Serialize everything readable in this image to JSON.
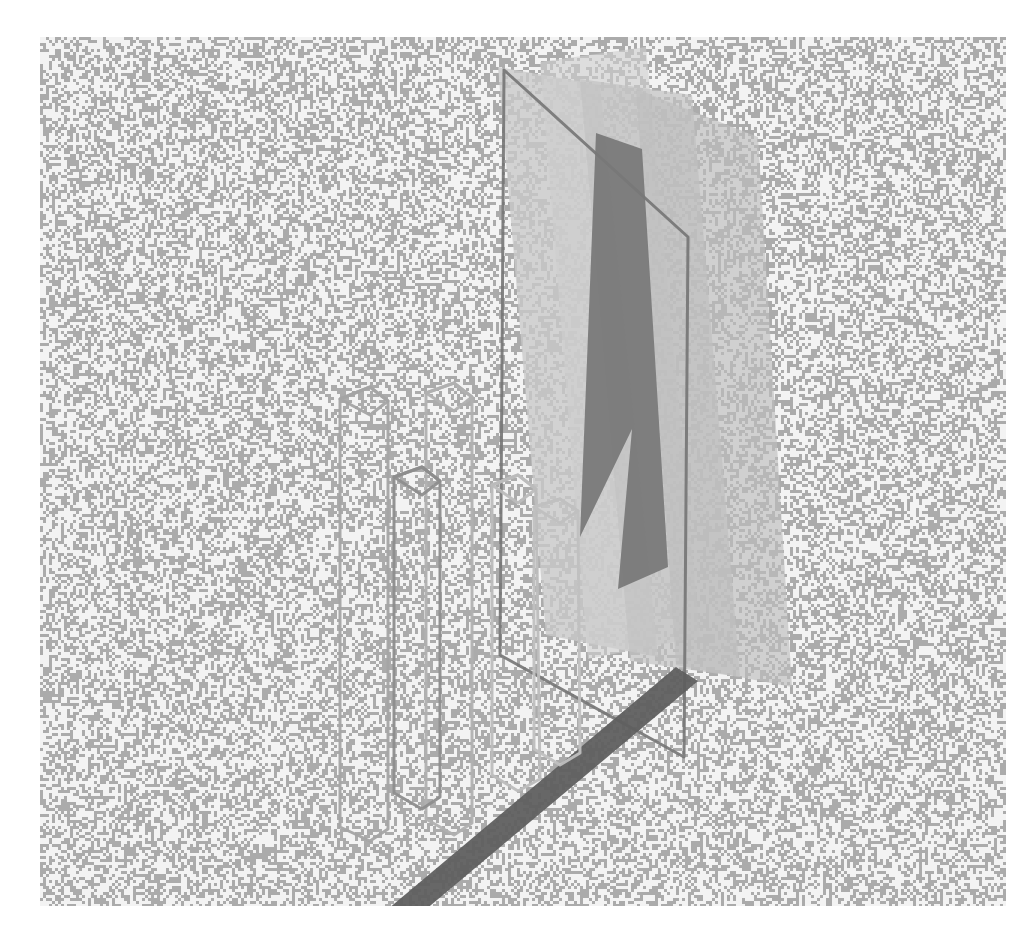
{
  "artwork": {
    "title": "Abstract Grayscale 3D Wireframe Composition",
    "medium": "raster-dither-render",
    "canvas": {
      "image_width": 1029,
      "image_height": 933,
      "margin_color": "#ffffff",
      "board_x": 40,
      "board_y": 37,
      "board_width": 966,
      "board_height": 869
    },
    "background": {
      "name": "dithered-noise-field",
      "pattern": "random two-tone pixel dither",
      "light_color": "#f3f3f3",
      "dark_color": "#ababab",
      "cell_size": 3,
      "dark_ratio": 0.46
    },
    "palette": {
      "line_light": "#b9b9b9",
      "line_mid": "#9a9a9a",
      "line_dark": "#6e6e6e",
      "line_darkest": "#5a5a5a",
      "fill_pale": "#d7d7d7",
      "fill_light": "#c6c6c6",
      "fill_mid": "#b2b2b2",
      "fill_dark": "#8e8e8e",
      "fill_darker": "#7c7c7c",
      "band_dark": "#6f6f6f"
    },
    "composition": {
      "description": "Translucent overlapping quadrilateral planes on the right, hollow wireframe prism columns on the left, joined by a heavy dark diagonal base band.",
      "groups": [
        {
          "name": "right-plane-cluster",
          "kind": "translucent-planes",
          "count": 6,
          "note": "Tall leaning parallelogram sheets in graduated grays"
        },
        {
          "name": "left-column-cluster",
          "kind": "wireframe-prisms",
          "count": 5,
          "note": "Hollow rectangular tubes drawn as outlines with hexagonal top caps"
        },
        {
          "name": "base-band",
          "kind": "solid-band",
          "count": 1,
          "note": "Thick dark diagonal strip running from lower-left apex up to the right"
        }
      ]
    },
    "shapes": {
      "planes": [
        {
          "name": "plane-outer-left",
          "points": "458,30 560,48 618,620 506,598",
          "fill": "#c9c9c9",
          "opacity": 0.8,
          "stroke": "none",
          "stroke_width": 0
        },
        {
          "name": "plane-tall-pale",
          "points": "500,25 606,10 660,600 548,622",
          "fill": "#cfcfcf",
          "opacity": 0.62,
          "stroke": "none",
          "stroke_width": 0
        },
        {
          "name": "plane-mid-light",
          "points": "540,42 652,58 700,640 590,624",
          "fill": "#c2c2c2",
          "opacity": 0.7,
          "stroke": "none",
          "stroke_width": 0
        },
        {
          "name": "plane-right-wide",
          "points": "596,52 718,100 752,650 636,628",
          "fill": "#bdbdbd",
          "opacity": 0.66,
          "stroke": "none",
          "stroke_width": 0
        },
        {
          "name": "plane-outline-big",
          "points": "464,33 648,200 644,720 460,618",
          "fill": "none",
          "opacity": 1.0,
          "stroke": "#747474",
          "stroke_width": 3
        },
        {
          "name": "plane-dark-ribbon",
          "points": "556,96 602,112 628,530 578,552 592,392 540,500",
          "fill": "#777777",
          "opacity": 0.92,
          "stroke": "none",
          "stroke_width": 0
        }
      ],
      "band": {
        "name": "base-diagonal-band",
        "points": "348,872 372,884 658,644 636,630",
        "fill": "#5f5f5f",
        "opacity": 0.95
      },
      "columns": [
        {
          "name": "column-1",
          "outline": "300,362 330,350 348,364 348,792 330,804 300,790",
          "cap": "300,362 330,350 348,364 330,378",
          "stroke": "#a4a4a4"
        },
        {
          "name": "column-2",
          "outline": "386,356 414,346 432,360 432,786 414,798 386,782",
          "cap": "386,356 414,346 432,360 414,374",
          "stroke": "#b0b0b0"
        },
        {
          "name": "column-3",
          "outline": "354,440 382,430 400,444 400,760 382,772 354,756",
          "cap": "354,440 382,430 400,444 382,458",
          "stroke": "#8d8d8d"
        },
        {
          "name": "column-4",
          "outline": "452,448 478,438 496,452 500,742 478,754 452,738",
          "cap": "452,448 478,438 496,452 478,466",
          "stroke": "#bcbcbc"
        },
        {
          "name": "column-5",
          "outline": "494,470 520,462 538,474 540,716 520,728 494,712",
          "cap": "494,470 520,462 538,474 520,486",
          "stroke": "#c0c0c0"
        }
      ]
    }
  }
}
